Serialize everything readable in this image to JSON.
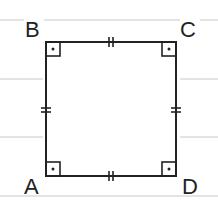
{
  "diagram": {
    "shape": "square",
    "vertices": [
      {
        "name": "A",
        "x": 46,
        "y": 176,
        "label_x": 24,
        "label_y": 195
      },
      {
        "name": "B",
        "x": 46,
        "y": 42,
        "label_x": 24,
        "label_y": 38
      },
      {
        "name": "C",
        "x": 176,
        "y": 42,
        "label_x": 180,
        "label_y": 38
      },
      {
        "name": "D",
        "x": 176,
        "y": 176,
        "label_x": 180,
        "label_y": 195
      }
    ],
    "right_angle_markers": [
      "A",
      "B",
      "C",
      "D"
    ],
    "equal_side_marks": {
      "AB": 2,
      "BC": 2,
      "CD": 2,
      "DA": 2
    },
    "ruled_lines_y": [
      20,
      79,
      137,
      196
    ],
    "colors": {
      "stroke": "#222222",
      "ruled_line": "#c8c8c8",
      "background": "#ffffff"
    }
  },
  "labels": {
    "A": "A",
    "B": "B",
    "C": "C",
    "D": "D"
  }
}
